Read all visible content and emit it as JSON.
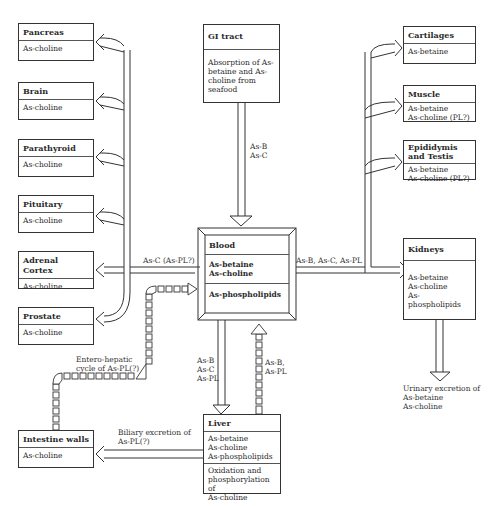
{
  "left_organs": [
    {
      "name": "Pancreas",
      "content": "As-choline"
    },
    {
      "name": "Brain",
      "content": "As-choline"
    },
    {
      "name": "Parathyroid",
      "content": "As-choline"
    },
    {
      "name": "Pituitary",
      "content": "As-choline"
    },
    {
      "name": "Adrenal Cortex",
      "content": "As-choline"
    },
    {
      "name": "Prostate",
      "content": "As-choline"
    }
  ],
  "right_organs": [
    {
      "name": "Cartilages",
      "content": "As-betaine"
    },
    {
      "name": "Muscle",
      "content": "As-betaine\nAs-choline (PL?)"
    },
    {
      "name": "Epididymis\nand Testis",
      "content": "As-betaine\nAs-choline (PL?)"
    }
  ],
  "gi_tract": {
    "name": "GI tract",
    "content": "Absorption of As-\nbetaine and As-\ncholine from\nseafood"
  },
  "blood": {
    "name": "Blood",
    "content": "As-betaine\nAs-choline",
    "content2": "As-phospholipids"
  },
  "kidneys": {
    "name": "Kidneys",
    "content": "As-betaine\nAs-choline\nAs-phospholipids"
  },
  "liver": {
    "name": "Liver",
    "content": "As-betaine\nAs-choline\nAs-phospholipids",
    "content2": "Oxidation and\nphosphorylation of\nAs-choline"
  },
  "intestine": {
    "name": "Intestine walls",
    "content": "As-choline"
  },
  "labels": {
    "gi_to_blood": "As-B\nAs-C",
    "blood_to_left": "As-C (As-PL?)",
    "blood_to_right": "As-B, As-C, As-PL",
    "blood_to_liver": "As-B\nAs-C\nAs-PL",
    "liver_to_blood": "As-B,\nAs-PL",
    "enterohepatic": "Entero-hepatic\ncycle of As-PL(?)",
    "biliary": "Biliary excretion of\nAs-PL(?)",
    "urinary": "Urinary excretion of\nAs-betaine\nAs-choline"
  }
}
